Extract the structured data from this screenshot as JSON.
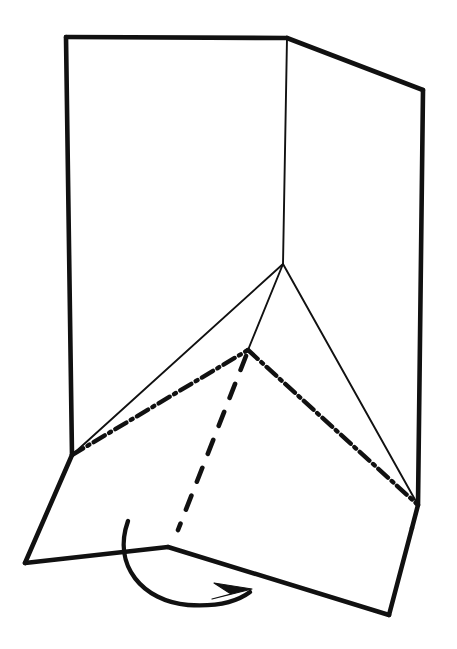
{
  "figure": {
    "background_color": "#ffffff",
    "ink_color": "#111111",
    "canvas": {
      "width": 457,
      "height": 649
    }
  },
  "geometry": {
    "vertices": {
      "top_left": [
        66,
        37
      ],
      "top_center": [
        287,
        38
      ],
      "top_right": [
        423,
        90
      ],
      "left_mid": [
        72,
        455
      ],
      "center_fold": [
        283,
        264
      ],
      "right_mid": [
        418,
        505
      ],
      "chain_apex": [
        248,
        350
      ],
      "bottom_left": [
        25,
        563
      ],
      "bottom_peak": [
        168,
        547
      ],
      "bottom_right": [
        389,
        615
      ],
      "right_lower": [
        412,
        528
      ],
      "dash_bottom": [
        178,
        530
      ]
    },
    "strokes": {
      "panel_left_outline": "M 66,37 L 287,38",
      "panel_left_edge": "M 66,37 L 72,455",
      "panel_top_right": "M 287,38 L 423,90",
      "panel_right_edge": "M 423,90 L 418,505 L 412,528",
      "center_fold_line": "M 287,38 L 283,264",
      "fold_to_left": "M 283,264 L 72,455",
      "fold_to_apex": "M 283,264 L 248,350",
      "fold_to_right": "M 283,264 L 418,505",
      "chain_left": "M 72,455 L 248,350",
      "chain_right": "M 248,350 L 418,505",
      "dashed_vertical": "M 246,356 L 178,530",
      "flap_left_edge": "M 72,455 L 25,563",
      "flap_bottom_left": "M 25,563 L 168,547",
      "flap_bottom_right": "M 168,547 L 389,615",
      "flap_right_edge": "M 389,615 L 412,528",
      "rotation_arrow": "M 128,521 C 112,566 143,601 188,605 C 218,607 238,601 250,592",
      "arrow_head": "M 252,589 L 214,583 L 231,594 L 212,599 Z"
    }
  },
  "line_styles": {
    "thick_solid": {
      "name": "cut-or-outer-edge",
      "width": 4.6,
      "dash": "none"
    },
    "thin_solid": {
      "name": "hidden-fold-edge",
      "width": 1.9,
      "dash": "none"
    },
    "chain": {
      "name": "fold-crease-chain-line",
      "width": 4.4,
      "dash": "13 5 2.2 5"
    },
    "dashed": {
      "name": "hidden-edge-dashed",
      "width": 4.6,
      "dash": "15 15"
    }
  },
  "annotations": {
    "arrow_label": "rotation-direction-arrow",
    "arrow_direction": "clockwise"
  }
}
